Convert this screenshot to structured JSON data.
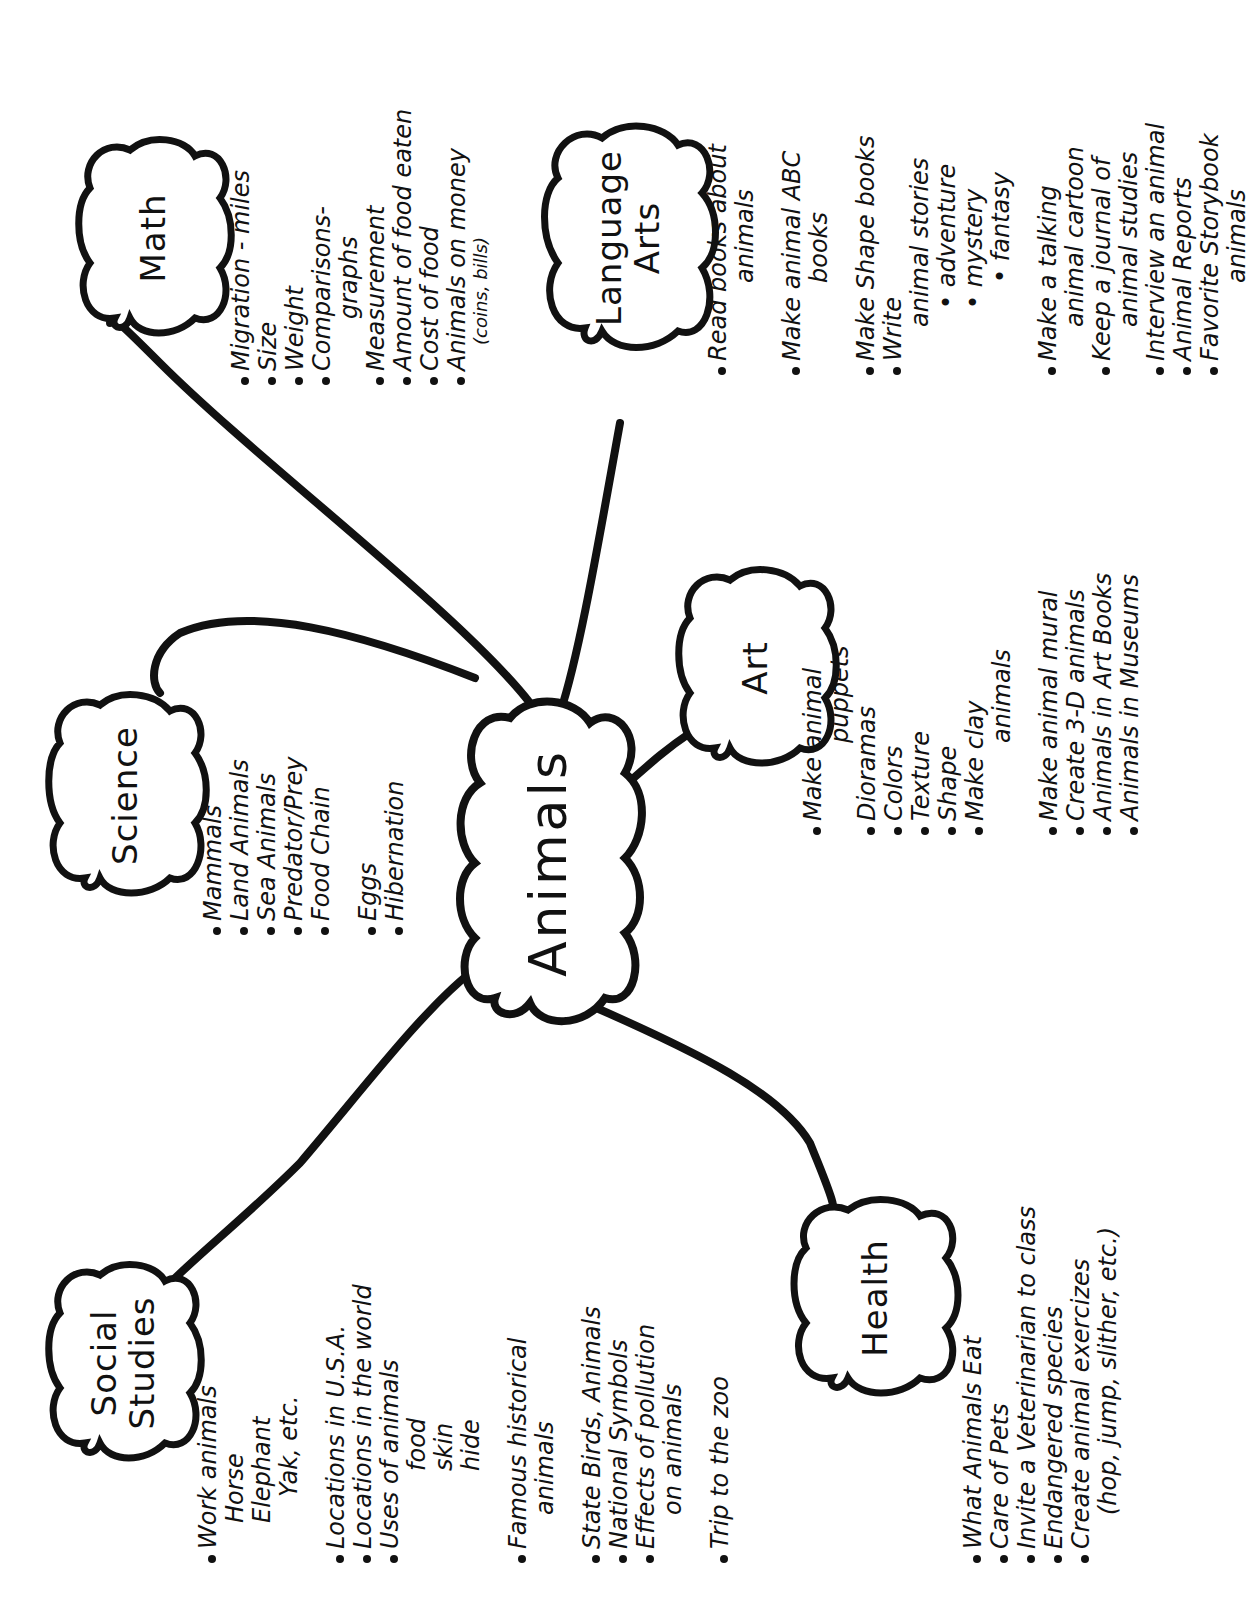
{
  "title": "Animals",
  "theme_color": "#111111",
  "background_color": "#ffffff",
  "center": {
    "label": "Animals"
  },
  "branches": [
    {
      "id": "social-studies",
      "label_line1": "Social",
      "label_line2": "Studies",
      "items": [
        {
          "text": "Work animals",
          "style": "bullet"
        },
        {
          "text": "Horse",
          "style": "sub"
        },
        {
          "text": "Elephant",
          "style": "sub"
        },
        {
          "text": "Yak, etc.",
          "style": "sub2"
        },
        {
          "text": "Locations in U.S.A.",
          "style": "bullet gap"
        },
        {
          "text": "Locations in the world",
          "style": "bullet"
        },
        {
          "text": "Uses of animals",
          "style": "bullet"
        },
        {
          "text": "food",
          "style": "sub3"
        },
        {
          "text": "skin",
          "style": "sub3"
        },
        {
          "text": "hide",
          "style": "sub3"
        },
        {
          "text": "Famous historical",
          "style": "bullet gap"
        },
        {
          "text": "animals",
          "style": "cont"
        },
        {
          "text": "State Birds, Animals",
          "style": "bullet gap"
        },
        {
          "text": "National Symbols",
          "style": "bullet"
        },
        {
          "text": "Effects of pollution",
          "style": "bullet"
        },
        {
          "text": "on animals",
          "style": "cont"
        },
        {
          "text": "Trip to the zoo",
          "style": "bullet gap"
        }
      ]
    },
    {
      "id": "science",
      "label_line1": "Science",
      "label_line2": "",
      "items": [
        {
          "text": "Mammals",
          "style": "bullet"
        },
        {
          "text": "Land Animals",
          "style": "bullet"
        },
        {
          "text": "Sea Animals",
          "style": "bullet"
        },
        {
          "text": "Predator/Prey",
          "style": "bullet"
        },
        {
          "text": "Food Chain",
          "style": "bullet"
        },
        {
          "text": "Eggs",
          "style": "bullet gap"
        },
        {
          "text": "Hibernation",
          "style": "bullet"
        }
      ]
    },
    {
      "id": "math",
      "label_line1": "Math",
      "label_line2": "",
      "items": [
        {
          "text": "Migration - miles",
          "style": "bullet"
        },
        {
          "text": "Size",
          "style": "bullet"
        },
        {
          "text": "Weight",
          "style": "bullet"
        },
        {
          "text": "Comparisons-",
          "style": "bullet"
        },
        {
          "text": "graphs",
          "style": "sub2"
        },
        {
          "text": "Measurement",
          "style": "bullet"
        },
        {
          "text": "Amount of food eaten",
          "style": "bullet"
        },
        {
          "text": "Cost of food",
          "style": "bullet"
        },
        {
          "text": "Animals on money",
          "style": "bullet"
        },
        {
          "text": "(coins, bills)",
          "style": "small"
        }
      ]
    },
    {
      "id": "language-arts",
      "label_line1": "Language",
      "label_line2": "Arts",
      "items": [
        {
          "text": "Read books about",
          "style": "bullet"
        },
        {
          "text": "animals",
          "style": "sub3"
        },
        {
          "text": "Make animal ABC",
          "style": "bullet gap"
        },
        {
          "text": "books",
          "style": "sub3"
        },
        {
          "text": "Make Shape books",
          "style": "bullet gap"
        },
        {
          "text": "Write",
          "style": "bullet"
        },
        {
          "text": "animal stories",
          "style": "cont"
        },
        {
          "text": "• adventure",
          "style": "sub2"
        },
        {
          "text": "• mystery",
          "style": "sub2"
        },
        {
          "text": "• fantasy",
          "style": "sub3"
        },
        {
          "text": "Make a talking",
          "style": "bullet gap"
        },
        {
          "text": "animal cartoon",
          "style": "cont"
        },
        {
          "text": "Keep a journal of",
          "style": "bullet"
        },
        {
          "text": "animal studies",
          "style": "cont"
        },
        {
          "text": "Interview an animal",
          "style": "bullet"
        },
        {
          "text": "Animal Reports",
          "style": "bullet"
        },
        {
          "text": "Favorite Storybook",
          "style": "bullet"
        },
        {
          "text": "animals",
          "style": "sub3"
        }
      ]
    },
    {
      "id": "art",
      "label_line1": "Art",
      "label_line2": "",
      "items": [
        {
          "text": "Make animal",
          "style": "bullet"
        },
        {
          "text": "puppets",
          "style": "sub3"
        },
        {
          "text": "Dioramas",
          "style": "bullet"
        },
        {
          "text": "Colors",
          "style": "bullet"
        },
        {
          "text": "Texture",
          "style": "bullet"
        },
        {
          "text": "Shape",
          "style": "bullet"
        },
        {
          "text": "Make clay",
          "style": "bullet"
        },
        {
          "text": "animals",
          "style": "sub3"
        },
        {
          "text": "Make animal mural",
          "style": "bullet gap"
        },
        {
          "text": "Create 3-D animals",
          "style": "bullet"
        },
        {
          "text": "Animals in Art Books",
          "style": "bullet"
        },
        {
          "text": "Animals in Museums",
          "style": "bullet"
        }
      ]
    },
    {
      "id": "health",
      "label_line1": "Health",
      "label_line2": "",
      "items": [
        {
          "text": "What Animals Eat",
          "style": "bullet"
        },
        {
          "text": "Care of Pets",
          "style": "bullet"
        },
        {
          "text": "Invite a Veterinarian to class",
          "style": "bullet"
        },
        {
          "text": "Endangered species",
          "style": "bullet"
        },
        {
          "text": "Create animal exercizes",
          "style": "bullet"
        },
        {
          "text": "(hop, jump, slither, etc.)",
          "style": "cont"
        }
      ]
    }
  ]
}
